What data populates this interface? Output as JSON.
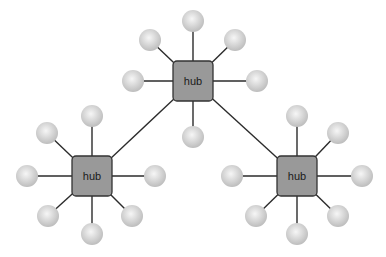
{
  "diagram": {
    "type": "network-topology",
    "colors": {
      "background": "#ffffff",
      "hub_fill": "#999999",
      "hub_stroke": "#333333",
      "node_fill_center": "#f4f4f4",
      "node_fill_edge": "#c2c2c2",
      "link": "#2b2b2b"
    },
    "hubs": [
      {
        "id": "hub-top",
        "label": "hub",
        "cx": 193,
        "cy": 81,
        "nodes": [
          [
            193,
            21
          ],
          [
            150,
            40
          ],
          [
            235,
            40
          ],
          [
            133,
            81
          ],
          [
            257,
            81
          ],
          [
            193,
            137
          ]
        ]
      },
      {
        "id": "hub-left",
        "label": "hub",
        "cx": 92,
        "cy": 176,
        "nodes": [
          [
            92,
            116
          ],
          [
            47,
            133
          ],
          [
            27,
            176
          ],
          [
            155,
            176
          ],
          [
            48,
            216
          ],
          [
            92,
            234
          ],
          [
            132,
            216
          ]
        ]
      },
      {
        "id": "hub-right",
        "label": "hub",
        "cx": 297,
        "cy": 176,
        "nodes": [
          [
            297,
            116
          ],
          [
            338,
            133
          ],
          [
            232,
            176
          ],
          [
            362,
            176
          ],
          [
            256,
            216
          ],
          [
            297,
            234
          ],
          [
            338,
            216
          ]
        ]
      }
    ],
    "hub_links": [
      [
        "hub-top",
        "hub-left"
      ],
      [
        "hub-top",
        "hub-right"
      ]
    ]
  }
}
